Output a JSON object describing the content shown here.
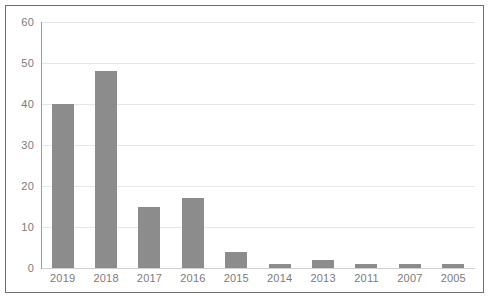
{
  "chart_data": {
    "type": "bar",
    "title": "",
    "subtitle": "",
    "xlabel": "",
    "ylabel": "",
    "categories": [
      "2019",
      "2018",
      "2017",
      "2016",
      "2015",
      "2014",
      "2013",
      "2011",
      "2007",
      "2005"
    ],
    "values": [
      40,
      48,
      15,
      17,
      4,
      1,
      2,
      1,
      1,
      1
    ],
    "series": [
      {
        "name": "",
        "values": [
          40,
          48,
          15,
          17,
          4,
          1,
          2,
          1,
          1,
          1
        ]
      }
    ],
    "ylim": [
      0,
      60
    ],
    "y_ticks": [
      0,
      10,
      20,
      30,
      40,
      50,
      60
    ],
    "y_tick_labels": [
      "0",
      "10",
      "20",
      "30",
      "40",
      "50",
      "60"
    ],
    "grid": "horizontal",
    "legend": "none",
    "annotations": [],
    "colors": {
      "bar": "#8c8c8c",
      "gridline": "#e6e6e6",
      "axis_line": "#9a9a9a",
      "frame": "#6f6f6f",
      "tick_label": "#7b7b7b",
      "background": "#ffffff"
    }
  }
}
